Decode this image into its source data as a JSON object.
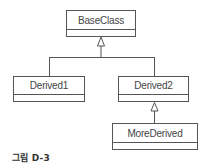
{
  "diagram": {
    "type": "uml-class-hierarchy",
    "classes": [
      {
        "id": "base",
        "name": "BaseClass"
      },
      {
        "id": "d1",
        "name": "Derived1"
      },
      {
        "id": "d2",
        "name": "Derived2"
      },
      {
        "id": "more",
        "name": "MoreDerived"
      }
    ],
    "relations": [
      {
        "from": "Derived1",
        "to": "BaseClass",
        "kind": "inheritance"
      },
      {
        "from": "Derived2",
        "to": "BaseClass",
        "kind": "inheritance"
      },
      {
        "from": "MoreDerived",
        "to": "Derived2",
        "kind": "inheritance"
      }
    ],
    "caption": "그림 D-3"
  },
  "colors": {
    "line": "#555555",
    "text": "#444444",
    "background": "#ffffff"
  }
}
